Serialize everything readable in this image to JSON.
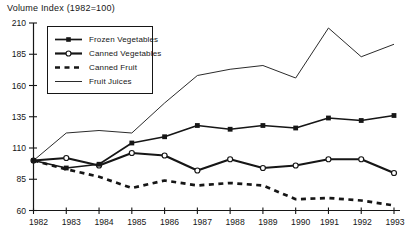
{
  "chart_data": {
    "type": "line",
    "title": "Volume Index (1982=100)",
    "categories": [
      1982,
      1983,
      1984,
      1985,
      1986,
      1987,
      1988,
      1989,
      1990,
      1991,
      1992,
      1993
    ],
    "yticks": [
      60,
      85,
      110,
      135,
      160,
      185,
      210
    ],
    "ylim": [
      60,
      210
    ],
    "grid": false,
    "legend_position": "upper-left-inside",
    "axis_color": "#161616",
    "background_color": "#ffffff",
    "series": [
      {
        "name": "Frozen Vegetables",
        "marker": "filled-square",
        "line_style": "solid",
        "line_width": 1.7,
        "color": "#161616",
        "values": [
          100,
          94,
          97,
          114,
          119,
          128,
          125,
          128,
          126,
          134,
          132,
          136
        ]
      },
      {
        "name": "Canned Vegetables",
        "marker": "open-circle",
        "line_style": "solid",
        "line_width": 2.2,
        "color": "#161616",
        "values": [
          100,
          102,
          96,
          106,
          104,
          92,
          101,
          94,
          96,
          101,
          101,
          90
        ]
      },
      {
        "name": "Canned Fruit",
        "marker": "none",
        "line_style": "dashed",
        "line_width": 2.7,
        "color": "#161616",
        "values": [
          100,
          93,
          87,
          78,
          84,
          80,
          82,
          80,
          69,
          70,
          68,
          64
        ]
      },
      {
        "name": "Fruit Juices",
        "marker": "none",
        "line_style": "solid",
        "line_width": 1,
        "color": "#2b2b2b",
        "values": [
          100,
          122,
          124,
          122,
          146,
          168,
          173,
          176,
          166,
          206,
          183,
          193
        ]
      }
    ]
  }
}
